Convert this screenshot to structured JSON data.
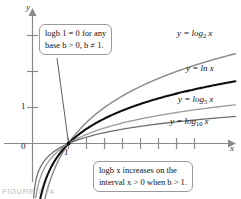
{
  "figure": {
    "caption": "FIGURE 7.24"
  },
  "axes": {
    "y_name": "y",
    "x_name": "x",
    "origin_label": "0",
    "y_tick_label": "1",
    "x_tick_label": "1"
  },
  "callouts": {
    "zero_point": {
      "line1": "logb 1 = 0 for any",
      "line2": "base b > 0, b ≠ 1."
    },
    "increasing": {
      "line1": "logb x increases on the",
      "line2": "interval x > 0 when b > 1."
    }
  },
  "curve_labels": {
    "log2": "y = log",
    "log2_sub": "2",
    "log2_arg": "x",
    "ln": "y = ln x",
    "log5": "y = log",
    "log5_sub": "5",
    "log5_arg": "x",
    "log10": "y = log",
    "log10_sub": "10",
    "log10_arg": "x"
  },
  "colors": {
    "axis": "#8a8a8a",
    "curve_ln": "#111111",
    "curve_log2": "#8d8d8d",
    "curve_log5": "#9a9a9a",
    "curve_log10": "#6f6f6f",
    "callout_border": "#9a9a9a",
    "background": "#ffffff"
  },
  "chart_data": {
    "type": "line",
    "xlabel": "x",
    "ylabel": "y",
    "xlim": [
      0,
      11.5
    ],
    "ylim": [
      -1.6,
      3.4
    ],
    "grid": false,
    "legend": "inline curve labels at right",
    "x_ticks": [
      1,
      2,
      3,
      4,
      5,
      6,
      7,
      8,
      9
    ],
    "x_tick_labels_shown": [
      "1"
    ],
    "y_ticks": [
      1,
      2,
      3
    ],
    "y_tick_labels_shown": [
      "0",
      "1"
    ],
    "annotations": [
      "log_b 1 = 0 for any base b > 0, b ≠ 1.",
      "log_b x increases on the interval x > 0 when b > 1."
    ],
    "series": [
      {
        "name": "y = log_2 x",
        "base": 2,
        "x": [
          0.15,
          0.3,
          0.5,
          0.75,
          1,
          1.5,
          2,
          3,
          4,
          5,
          6,
          7,
          8,
          9,
          10,
          11
        ],
        "y": [
          -2.74,
          -1.74,
          -1.0,
          -0.415,
          0,
          0.585,
          1.0,
          1.585,
          2.0,
          2.322,
          2.585,
          2.807,
          3.0,
          3.17,
          3.322,
          3.459
        ]
      },
      {
        "name": "y = ln x",
        "base": 2.71828,
        "x": [
          0.15,
          0.3,
          0.5,
          0.75,
          1,
          1.5,
          2,
          3,
          4,
          5,
          6,
          7,
          8,
          9,
          10,
          11
        ],
        "y": [
          -1.897,
          -1.204,
          -0.693,
          -0.288,
          0,
          0.405,
          0.693,
          1.099,
          1.386,
          1.609,
          1.792,
          1.946,
          2.079,
          2.197,
          2.303,
          2.398
        ]
      },
      {
        "name": "y = log_5 x",
        "base": 5,
        "x": [
          0.15,
          0.3,
          0.5,
          0.75,
          1,
          1.5,
          2,
          3,
          4,
          5,
          6,
          7,
          8,
          9,
          10,
          11
        ],
        "y": [
          -1.179,
          -0.748,
          -0.431,
          -0.179,
          0,
          0.252,
          0.431,
          0.683,
          0.861,
          1.0,
          1.113,
          1.209,
          1.292,
          1.365,
          1.431,
          1.49
        ]
      },
      {
        "name": "y = log_10 x",
        "base": 10,
        "x": [
          0.15,
          0.3,
          0.5,
          0.75,
          1,
          1.5,
          2,
          3,
          4,
          5,
          6,
          7,
          8,
          9,
          10,
          11
        ],
        "y": [
          -0.824,
          -0.523,
          -0.301,
          -0.125,
          0,
          0.176,
          0.301,
          0.477,
          0.602,
          0.699,
          0.778,
          0.845,
          0.903,
          0.954,
          1.0,
          1.041
        ]
      }
    ]
  }
}
